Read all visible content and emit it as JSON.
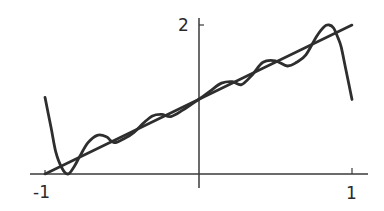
{
  "chart_data": {
    "type": "line",
    "title": "",
    "xlabel": "",
    "ylabel": "",
    "xlim": [
      -1,
      1
    ],
    "ylim": [
      0,
      2
    ],
    "grid": false,
    "legend": null,
    "x_ticks": [
      {
        "value": -1,
        "label": "-1"
      },
      {
        "value": 1,
        "label": "1"
      }
    ],
    "y_ticks": [
      {
        "value": 2,
        "label": "2"
      }
    ],
    "series": [
      {
        "name": "f(x) = x + 1",
        "style": "straight line",
        "x": [
          -1,
          1
        ],
        "y": [
          0,
          2
        ]
      },
      {
        "name": "polynomial interpolant (oscillating)",
        "style": "wiggly curve with edge blow-up",
        "x": [
          -1.0,
          -0.96,
          -0.93,
          -0.89,
          -0.85,
          -0.81,
          -0.77,
          -0.72,
          -0.66,
          -0.6,
          -0.55,
          -0.48,
          -0.42,
          -0.36,
          -0.3,
          -0.24,
          -0.18,
          -0.1,
          0.0,
          0.08,
          0.15,
          0.22,
          0.28,
          0.35,
          0.42,
          0.5,
          0.58,
          0.64,
          0.7,
          0.77,
          0.82,
          0.85,
          0.88,
          0.91,
          0.93,
          0.96,
          1.0
        ],
        "y": [
          1.03,
          0.62,
          0.3,
          0.08,
          0.0,
          0.1,
          0.25,
          0.42,
          0.52,
          0.5,
          0.42,
          0.48,
          0.56,
          0.68,
          0.78,
          0.8,
          0.77,
          0.86,
          1.0,
          1.12,
          1.22,
          1.24,
          1.2,
          1.33,
          1.5,
          1.52,
          1.45,
          1.5,
          1.6,
          1.85,
          1.98,
          2.0,
          1.96,
          1.82,
          1.7,
          1.4,
          1.0
        ]
      }
    ]
  },
  "axes": {
    "x_axis_label_left": "-1",
    "x_axis_label_right": "1",
    "y_axis_label_top": "2"
  },
  "colors": {
    "curve": "#2e2e2e",
    "axis": "#3a3a3a",
    "background": "#ffffff"
  }
}
